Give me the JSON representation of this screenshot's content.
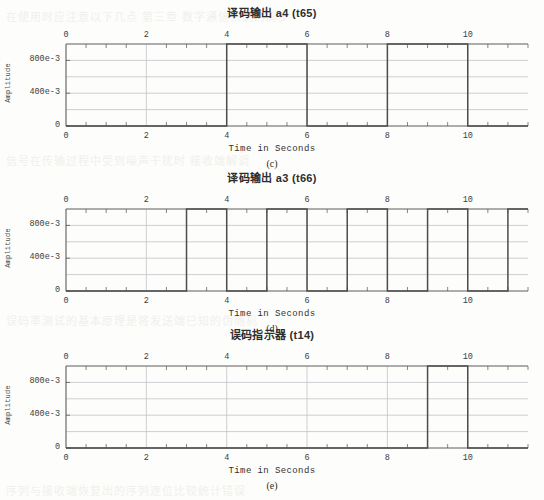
{
  "page": {
    "background_color": "#fdfdfb",
    "grid_color": "#b9bcc2",
    "trace_color": "#4d4d4d",
    "axis_color": "#555555",
    "bleed_text": [
      {
        "text": "在使用时应注意以下几点  第三章 数字通信系统的同步",
        "x": 6,
        "y": 8
      },
      {
        "text": "信号在传输过程中受到噪声干扰时 接收端解调",
        "x": 6,
        "y": 152
      },
      {
        "text": "误码率测试的基本原理是将发送端已知的伪随机",
        "x": 6,
        "y": 312
      },
      {
        "text": "序列与接收端恢复出的序列逐位比较统计错误",
        "x": 6,
        "y": 482
      }
    ]
  },
  "charts": [
    {
      "id": "chart-c",
      "title": "译码输出 a4  (t65)",
      "subcaption": "(c)",
      "xlabel": "Time in Seconds",
      "ylabel": "Amplitude",
      "chart_data": {
        "type": "line",
        "title": "译码输出 a4  (t65)",
        "xlabel": "Time in Seconds",
        "ylabel": "Amplitude",
        "xlim": [
          0,
          11.5
        ],
        "ylim": [
          0,
          1.0
        ],
        "xticks": [
          0,
          2,
          4,
          6,
          8,
          10
        ],
        "xtick_labels": [
          "0",
          "2",
          "4",
          "6",
          "8",
          "10"
        ],
        "xminor_step": 0.5,
        "yticks": [
          0,
          0.4,
          0.8
        ],
        "ytick_labels": [
          "0",
          "400e-3",
          "800e-3"
        ],
        "ygrid_values": [
          0,
          0.2,
          0.4,
          0.6,
          0.8,
          1.0
        ],
        "grid": true,
        "legend": "none",
        "dual_x_axis": true,
        "waveform_high_intervals": [
          [
            4,
            6
          ],
          [
            8,
            10
          ]
        ],
        "points": [
          {
            "t": 0,
            "v": 0
          },
          {
            "t": 4,
            "v": 0
          },
          {
            "t": 4,
            "v": 1
          },
          {
            "t": 6,
            "v": 1
          },
          {
            "t": 6,
            "v": 0
          },
          {
            "t": 8,
            "v": 0
          },
          {
            "t": 8,
            "v": 1
          },
          {
            "t": 10,
            "v": 1
          },
          {
            "t": 10,
            "v": 0
          },
          {
            "t": 11.5,
            "v": 0
          }
        ]
      }
    },
    {
      "id": "chart-d",
      "title": "译码输出 a3  (t66)",
      "subcaption": "(d)",
      "xlabel": "Time in Seconds",
      "ylabel": "Amplitude",
      "chart_data": {
        "type": "line",
        "title": "译码输出 a3  (t66)",
        "xlabel": "Time in Seconds",
        "ylabel": "Amplitude",
        "xlim": [
          0,
          11.5
        ],
        "ylim": [
          0,
          1.0
        ],
        "xticks": [
          0,
          2,
          4,
          6,
          8,
          10
        ],
        "xtick_labels": [
          "0",
          "2",
          "4",
          "6",
          "8",
          "10"
        ],
        "xminor_step": 0.5,
        "yticks": [
          0,
          0.4,
          0.8
        ],
        "ytick_labels": [
          "0",
          "400e-3",
          "800e-3"
        ],
        "ygrid_values": [
          0,
          0.2,
          0.4,
          0.6,
          0.8,
          1.0
        ],
        "grid": true,
        "legend": "none",
        "dual_x_axis": true,
        "waveform_high_intervals": [
          [
            3,
            4
          ],
          [
            5,
            6
          ],
          [
            7,
            8
          ],
          [
            9,
            10
          ],
          [
            11,
            11.5
          ]
        ],
        "points": [
          {
            "t": 0,
            "v": 0
          },
          {
            "t": 3,
            "v": 0
          },
          {
            "t": 3,
            "v": 1
          },
          {
            "t": 4,
            "v": 1
          },
          {
            "t": 4,
            "v": 0
          },
          {
            "t": 5,
            "v": 0
          },
          {
            "t": 5,
            "v": 1
          },
          {
            "t": 6,
            "v": 1
          },
          {
            "t": 6,
            "v": 0
          },
          {
            "t": 7,
            "v": 0
          },
          {
            "t": 7,
            "v": 1
          },
          {
            "t": 8,
            "v": 1
          },
          {
            "t": 8,
            "v": 0
          },
          {
            "t": 9,
            "v": 0
          },
          {
            "t": 9,
            "v": 1
          },
          {
            "t": 10,
            "v": 1
          },
          {
            "t": 10,
            "v": 0
          },
          {
            "t": 11,
            "v": 0
          },
          {
            "t": 11,
            "v": 1
          },
          {
            "t": 11.5,
            "v": 1
          }
        ]
      }
    },
    {
      "id": "chart-e",
      "title": "误码指示器  (t14)",
      "subcaption": "(e)",
      "xlabel": "Time in Seconds",
      "ylabel": "Amplitude",
      "chart_data": {
        "type": "line",
        "title": "误码指示器  (t14)",
        "xlabel": "Time in Seconds",
        "ylabel": "Amplitude",
        "xlim": [
          0,
          11.5
        ],
        "ylim": [
          0,
          1.0
        ],
        "xticks": [
          0,
          2,
          4,
          6,
          8,
          10
        ],
        "xtick_labels": [
          "0",
          "2",
          "4",
          "6",
          "8",
          "10"
        ],
        "xminor_step": 0.5,
        "yticks": [
          0,
          0.4,
          0.8
        ],
        "ytick_labels": [
          "0",
          "400e-3",
          "800e-3"
        ],
        "ygrid_values": [
          0,
          0.2,
          0.4,
          0.6,
          0.8,
          1.0
        ],
        "grid": true,
        "legend": "none",
        "dual_x_axis": true,
        "waveform_high_intervals": [
          [
            9,
            10
          ]
        ],
        "points": [
          {
            "t": 0,
            "v": 0
          },
          {
            "t": 9,
            "v": 0
          },
          {
            "t": 9,
            "v": 1
          },
          {
            "t": 10,
            "v": 1
          },
          {
            "t": 10,
            "v": 0
          },
          {
            "t": 11.5,
            "v": 0
          }
        ]
      }
    }
  ]
}
